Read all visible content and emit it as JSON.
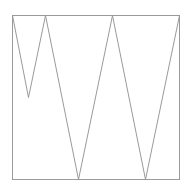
{
  "caption": {
    "text": ""
  },
  "figure": {
    "stroke": "#9a9a9a",
    "frame": {
      "x": 12,
      "y": 15,
      "width": 167,
      "height": 164
    },
    "zigzag_points": [
      [
        12,
        15
      ],
      [
        28,
        97
      ],
      [
        45,
        15
      ],
      [
        78,
        179
      ],
      [
        112,
        15
      ],
      [
        145,
        179
      ],
      [
        179,
        15
      ]
    ]
  }
}
